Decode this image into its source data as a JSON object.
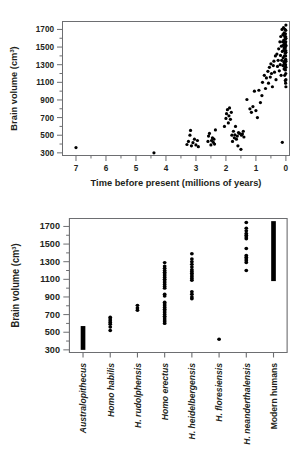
{
  "figure": {
    "name": "hominin-brain-volume-figure"
  },
  "chart_data": [
    {
      "type": "scatter",
      "id": "brain-volume-vs-time",
      "title": "",
      "xlabel": "Time before present (millions of years)",
      "ylabel": "Brain volume (cm³)",
      "y_unit": "cm³",
      "xlim": [
        7.45,
        -0.12
      ],
      "ylim": [
        270,
        1790
      ],
      "x_reversed": true,
      "grid": false,
      "legend": "none",
      "xticks": [
        7,
        6,
        5,
        4,
        3,
        2,
        1,
        0
      ],
      "xtick_labels": [
        "7",
        "6",
        "5",
        "4",
        "3",
        "2",
        "1",
        "0"
      ],
      "x_minor_ticks": [
        6.5,
        5.5,
        4.5,
        3.5,
        2.5,
        1.5,
        0.5
      ],
      "yticks": [
        300,
        500,
        700,
        900,
        1100,
        1300,
        1500,
        1700
      ],
      "ytick_labels": [
        "300",
        "500",
        "700",
        "900",
        "1100",
        "1300",
        "1500",
        "1700"
      ],
      "y_minor_ticks": [
        400,
        600,
        800,
        1000,
        1200,
        1400,
        1600
      ],
      "marker": "filled-circle",
      "marker_size": 1.6,
      "points": [
        [
          7.0,
          360
        ],
        [
          4.4,
          300
        ],
        [
          3.3,
          395
        ],
        [
          3.25,
          430
        ],
        [
          3.2,
          500
        ],
        [
          3.18,
          555
        ],
        [
          3.15,
          380
        ],
        [
          3.1,
          415
        ],
        [
          3.05,
          455
        ],
        [
          3.0,
          390
        ],
        [
          2.95,
          440
        ],
        [
          2.92,
          370
        ],
        [
          2.6,
          430
        ],
        [
          2.58,
          490
        ],
        [
          2.55,
          520
        ],
        [
          2.5,
          390
        ],
        [
          2.48,
          440
        ],
        [
          2.45,
          470
        ],
        [
          2.42,
          420
        ],
        [
          2.4,
          455
        ],
        [
          2.38,
          400
        ],
        [
          2.35,
          560
        ],
        [
          2.05,
          600
        ],
        [
          2.0,
          690
        ],
        [
          1.98,
          745
        ],
        [
          1.95,
          790
        ],
        [
          1.92,
          640
        ],
        [
          1.9,
          720
        ],
        [
          1.88,
          810
        ],
        [
          1.85,
          680
        ],
        [
          1.82,
          760
        ],
        [
          1.8,
          500
        ],
        [
          1.78,
          430
        ],
        [
          1.75,
          545
        ],
        [
          1.72,
          470
        ],
        [
          1.7,
          505
        ],
        [
          1.68,
          600
        ],
        [
          1.65,
          455
        ],
        [
          1.62,
          490
        ],
        [
          1.6,
          380
        ],
        [
          1.58,
          530
        ],
        [
          1.55,
          520
        ],
        [
          1.5,
          340
        ],
        [
          1.48,
          500
        ],
        [
          1.45,
          515
        ],
        [
          1.42,
          545
        ],
        [
          1.4,
          480
        ],
        [
          1.3,
          905
        ],
        [
          1.2,
          800
        ],
        [
          1.15,
          760
        ],
        [
          1.1,
          825
        ],
        [
          1.05,
          1000
        ],
        [
          1.0,
          780
        ],
        [
          0.95,
          700
        ],
        [
          0.9,
          1010
        ],
        [
          0.85,
          870
        ],
        [
          0.8,
          950
        ],
        [
          0.78,
          1100
        ],
        [
          0.72,
          1180
        ],
        [
          0.68,
          1030
        ],
        [
          0.65,
          1150
        ],
        [
          0.6,
          1225
        ],
        [
          0.58,
          1090
        ],
        [
          0.55,
          1270
        ],
        [
          0.52,
          1160
        ],
        [
          0.5,
          1310
        ],
        [
          0.48,
          1200
        ],
        [
          0.45,
          1050
        ],
        [
          0.42,
          1290
        ],
        [
          0.4,
          1340
        ],
        [
          0.38,
          1215
        ],
        [
          0.35,
          1400
        ],
        [
          0.33,
          1130
        ],
        [
          0.3,
          1420
        ],
        [
          0.28,
          1280
        ],
        [
          0.26,
          1350
        ],
        [
          0.24,
          1480
        ],
        [
          0.22,
          1230
        ],
        [
          0.2,
          1560
        ],
        [
          0.19,
          1300
        ],
        [
          0.18,
          1405
        ],
        [
          0.17,
          1620
        ],
        [
          0.16,
          1180
        ],
        [
          0.15,
          1510
        ],
        [
          0.14,
          1350
        ],
        [
          0.13,
          1700
        ],
        [
          0.12,
          1450
        ],
        [
          0.11,
          1560
        ],
        [
          0.1,
          1290
        ],
        [
          0.1,
          1640
        ],
        [
          0.09,
          1380
        ],
        [
          0.09,
          1520
        ],
        [
          0.08,
          1460
        ],
        [
          0.08,
          1720
        ],
        [
          0.07,
          1330
        ],
        [
          0.07,
          1580
        ],
        [
          0.06,
          1250
        ],
        [
          0.06,
          1490
        ],
        [
          0.06,
          1660
        ],
        [
          0.05,
          1400
        ],
        [
          0.05,
          1550
        ],
        [
          0.05,
          1310
        ],
        [
          0.04,
          1620
        ],
        [
          0.04,
          1460
        ],
        [
          0.04,
          1180
        ],
        [
          0.03,
          1530
        ],
        [
          0.03,
          1350
        ],
        [
          0.03,
          1700
        ],
        [
          0.03,
          1270
        ],
        [
          0.02,
          1590
        ],
        [
          0.02,
          1430
        ],
        [
          0.02,
          1120
        ],
        [
          0.02,
          1490
        ],
        [
          0.02,
          1330
        ],
        [
          0.015,
          1650
        ],
        [
          0.015,
          1240
        ],
        [
          0.015,
          1550
        ],
        [
          0.01,
          1400
        ],
        [
          0.01,
          1090
        ],
        [
          0.01,
          1510
        ],
        [
          0.01,
          1620
        ],
        [
          0.01,
          1300
        ],
        [
          0.005,
          1460
        ],
        [
          0.005,
          1200
        ],
        [
          0.005,
          1560
        ],
        [
          0.005,
          1360
        ],
        [
          0.005,
          1690
        ],
        [
          0.0,
          1440
        ],
        [
          0.0,
          1520
        ],
        [
          0.0,
          1270
        ],
        [
          0.0,
          1600
        ],
        [
          0.0,
          1340
        ],
        [
          0.0,
          1750
        ],
        [
          0.0,
          1130
        ],
        [
          0.0,
          1050
        ],
        [
          0.12,
          420
        ]
      ]
    },
    {
      "type": "scatter",
      "id": "brain-volume-by-species",
      "title": "",
      "xlabel": "",
      "ylabel": "Brain volume (cm³)",
      "y_unit": "cm³",
      "ylim": [
        270,
        1790
      ],
      "grid": false,
      "legend": "none",
      "yticks": [
        300,
        500,
        700,
        900,
        1100,
        1300,
        1500,
        1700
      ],
      "ytick_labels": [
        "300",
        "500",
        "700",
        "900",
        "1100",
        "1300",
        "1500",
        "1700"
      ],
      "y_minor_ticks": [
        400,
        600,
        800,
        1000,
        1200,
        1400,
        1600
      ],
      "categories": [
        "Australopithecus",
        "Homo habilis",
        "H. rudolphensis",
        "Homo erectus",
        "H. heidelbergensis",
        "H. floresiensis",
        "H. neanderthalensis",
        "Modern humans"
      ],
      "category_styles": [
        "italic",
        "italic",
        "italic",
        "italic",
        "italic",
        "italic",
        "italic",
        "upright"
      ],
      "series": [
        {
          "name": "Australopithecus",
          "render": "bar",
          "range": [
            300,
            570
          ],
          "values": [
            300,
            320,
            340,
            360,
            380,
            400,
            420,
            440,
            460,
            480,
            500,
            520,
            540,
            560,
            570
          ]
        },
        {
          "name": "Homo habilis",
          "render": "points",
          "values": [
            520,
            560,
            590,
            610,
            630,
            650,
            670
          ]
        },
        {
          "name": "H. rudolphensis",
          "render": "points",
          "values": [
            750,
            775,
            805
          ]
        },
        {
          "name": "Homo erectus",
          "render": "points",
          "values": [
            600,
            620,
            640,
            660,
            680,
            700,
            720,
            740,
            760,
            780,
            800,
            820,
            840,
            910,
            930,
            1000,
            1020,
            1040,
            1060,
            1080,
            1100,
            1120,
            1140,
            1160,
            1180,
            1200,
            1225,
            1250,
            1290
          ]
        },
        {
          "name": "H. heidelbergensis",
          "render": "points",
          "values": [
            880,
            900,
            930,
            960,
            1090,
            1110,
            1130,
            1150,
            1170,
            1190,
            1210,
            1240,
            1270,
            1300,
            1330,
            1390
          ]
        },
        {
          "name": "H. floresiensis",
          "render": "points",
          "values": [
            420
          ]
        },
        {
          "name": "H. neanderthalensis",
          "render": "points",
          "values": [
            1200,
            1290,
            1310,
            1330,
            1350,
            1370,
            1450,
            1560,
            1580,
            1600,
            1620,
            1650,
            1680,
            1745
          ]
        },
        {
          "name": "Modern humans",
          "render": "bar",
          "range": [
            1080,
            1760
          ],
          "values": [
            1080,
            1150,
            1220,
            1290,
            1360,
            1430,
            1500,
            1570,
            1640,
            1700,
            1760
          ]
        }
      ]
    }
  ]
}
